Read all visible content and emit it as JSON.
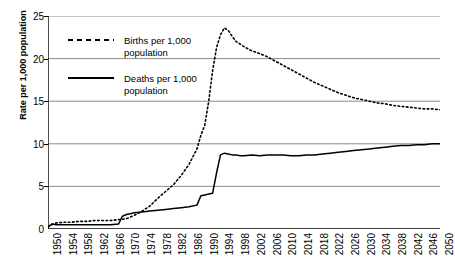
{
  "chart_data": {
    "type": "line",
    "title": "",
    "xlabel": "",
    "ylabel": "Rate per 1,000 population",
    "xlim": [
      1950,
      2050
    ],
    "ylim": [
      0,
      25
    ],
    "yticks": [
      0,
      5,
      10,
      15,
      20,
      25
    ],
    "xticks": [
      1950,
      1954,
      1958,
      1962,
      1966,
      1970,
      1974,
      1978,
      1982,
      1986,
      1990,
      1994,
      1998,
      2002,
      2006,
      2010,
      2014,
      2018,
      2022,
      2026,
      2030,
      2034,
      2038,
      2042,
      2046,
      2050
    ],
    "minor_tick_interval": 1,
    "grid": "horizontal",
    "legend_position": "top-left",
    "series": [
      {
        "name": "Births per 1,000 population",
        "style": "dashed",
        "color": "#000000",
        "x": [
          1950,
          1952,
          1954,
          1956,
          1958,
          1960,
          1962,
          1964,
          1966,
          1968,
          1970,
          1972,
          1974,
          1976,
          1978,
          1980,
          1982,
          1984,
          1986,
          1988,
          1989,
          1990,
          1991,
          1992,
          1993,
          1994,
          1995,
          1996,
          1997,
          1998,
          2000,
          2002,
          2004,
          2006,
          2008,
          2010,
          2012,
          2014,
          2016,
          2018,
          2020,
          2022,
          2024,
          2026,
          2028,
          2030,
          2032,
          2034,
          2036,
          2038,
          2040,
          2042,
          2044,
          2046,
          2048,
          2050
        ],
        "y": [
          0.3,
          0.7,
          0.8,
          0.8,
          0.9,
          0.9,
          1.0,
          1.0,
          1.0,
          1.1,
          1.2,
          1.6,
          2.1,
          2.7,
          3.6,
          4.4,
          5.2,
          6.3,
          7.6,
          9.4,
          11.0,
          12.2,
          15.0,
          18.6,
          21.3,
          22.8,
          23.6,
          23.3,
          22.6,
          22.0,
          21.4,
          20.9,
          20.6,
          20.2,
          19.7,
          19.2,
          18.7,
          18.2,
          17.7,
          17.2,
          16.8,
          16.4,
          16.0,
          15.7,
          15.4,
          15.2,
          15.0,
          14.8,
          14.7,
          14.5,
          14.4,
          14.3,
          14.2,
          14.1,
          14.1,
          14.0
        ]
      },
      {
        "name": "Deaths per 1,000 population",
        "style": "solid",
        "color": "#000000",
        "x": [
          1950,
          1951,
          1952,
          1954,
          1956,
          1958,
          1960,
          1962,
          1964,
          1966,
          1968,
          1969,
          1970,
          1971,
          1972,
          1974,
          1976,
          1978,
          1980,
          1982,
          1984,
          1986,
          1988,
          1989,
          1990,
          1991,
          1992,
          1993,
          1994,
          1995,
          1996,
          1997,
          1998,
          1999,
          2000,
          2002,
          2004,
          2006,
          2008,
          2010,
          2012,
          2014,
          2016,
          2018,
          2020,
          2022,
          2024,
          2026,
          2028,
          2030,
          2032,
          2034,
          2036,
          2038,
          2040,
          2042,
          2044,
          2046,
          2048,
          2050
        ],
        "y": [
          0.2,
          0.6,
          0.5,
          0.5,
          0.5,
          0.5,
          0.5,
          0.5,
          0.5,
          0.5,
          0.6,
          1.5,
          1.7,
          1.8,
          1.9,
          2.0,
          2.1,
          2.2,
          2.3,
          2.4,
          2.5,
          2.6,
          2.8,
          3.9,
          4.0,
          4.1,
          4.2,
          6.6,
          8.7,
          8.9,
          8.8,
          8.7,
          8.7,
          8.6,
          8.6,
          8.7,
          8.6,
          8.7,
          8.7,
          8.7,
          8.6,
          8.6,
          8.7,
          8.7,
          8.8,
          8.9,
          9.0,
          9.1,
          9.2,
          9.3,
          9.4,
          9.5,
          9.6,
          9.7,
          9.8,
          9.8,
          9.9,
          9.9,
          10.0,
          10.0
        ]
      }
    ]
  },
  "legend": {
    "items": [
      {
        "label_line1": "Births per 1,000",
        "label_line2": "population",
        "style": "dashed"
      },
      {
        "label_line1": "Deaths per 1,000",
        "label_line2": "population",
        "style": "solid"
      }
    ]
  }
}
